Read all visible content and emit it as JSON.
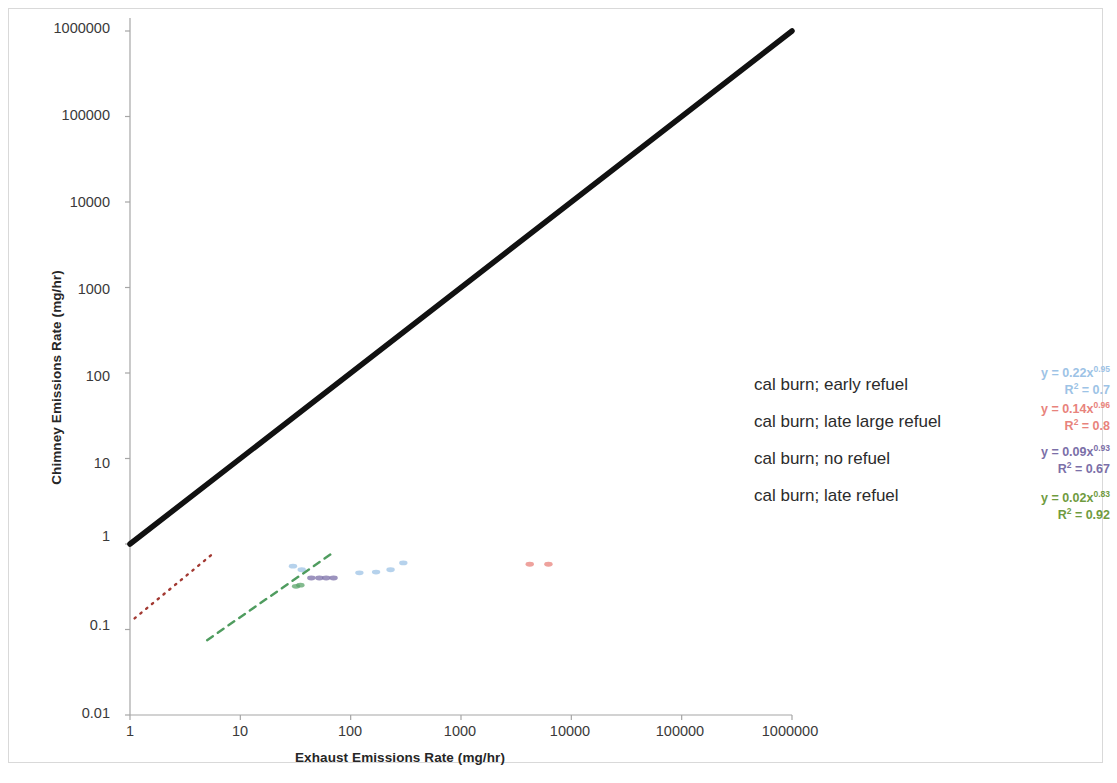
{
  "chart_data": {
    "type": "scatter",
    "title": "",
    "xlabel": "Exhaust Emissions Rate (mg/hr)",
    "ylabel": "Chimney Emissions Rate (mg/hr)",
    "xscale": "log",
    "yscale": "log",
    "xlim": [
      1,
      1000000
    ],
    "ylim": [
      0.01,
      1000000
    ],
    "xticks": [
      "1",
      "10",
      "100",
      "1000",
      "10000",
      "100000",
      "1000000"
    ],
    "yticks": [
      "0.01",
      "0.1",
      "1",
      "10",
      "100",
      "1000",
      "10000",
      "100000",
      "1000000"
    ],
    "grid": false,
    "legend_position": "right-inside",
    "reference_line": {
      "name": "1:1 line",
      "color": "#111111",
      "x": [
        1,
        1000000
      ],
      "y": [
        1,
        1000000
      ]
    },
    "series": [
      {
        "name": "cal burn; early refuel",
        "color": "#9dc3e6",
        "equation": "y = 0.22x",
        "exponent": "0.95",
        "r2_label": "R",
        "r2_sup": "2",
        "r2_value": " = 0.7",
        "points": [
          {
            "x": 30,
            "y": 0.55
          },
          {
            "x": 36,
            "y": 0.5
          },
          {
            "x": 120,
            "y": 0.46
          },
          {
            "x": 170,
            "y": 0.47
          },
          {
            "x": 230,
            "y": 0.5
          },
          {
            "x": 300,
            "y": 0.6
          }
        ]
      },
      {
        "name": "cal burn; late large refuel",
        "color": "#e8837c",
        "equation": "y = 0.14x",
        "exponent": "0.96",
        "r2_label": "R",
        "r2_sup": "2",
        "r2_value": " = 0.8",
        "trend": {
          "x": [
            1.1,
            5.5
          ],
          "y": [
            0.135,
            0.75
          ],
          "style": "dotted",
          "color": "#a33a33"
        },
        "points": [
          {
            "x": 4200,
            "y": 0.58
          },
          {
            "x": 6200,
            "y": 0.58
          }
        ]
      },
      {
        "name": "cal burn; no refuel",
        "color": "#7b6fa8",
        "equation": "y = 0.09x",
        "exponent": "0.93",
        "r2_label": "R",
        "r2_sup": "2",
        "r2_value": " = 0.67",
        "points": [
          {
            "x": 44,
            "y": 0.4
          },
          {
            "x": 52,
            "y": 0.4
          },
          {
            "x": 60,
            "y": 0.4
          },
          {
            "x": 70,
            "y": 0.4
          }
        ]
      },
      {
        "name": "cal burn; late refuel",
        "color": "#5aa469",
        "equation": "y = 0.02x",
        "exponent": "0.83",
        "r2_label": "R",
        "r2_sup": "2",
        "r2_value": " = 0.92",
        "trend": {
          "x": [
            5.0,
            70
          ],
          "y": [
            0.075,
            0.8
          ],
          "style": "dashed",
          "color": "#4f9c5f"
        },
        "points": [
          {
            "x": 32,
            "y": 0.32
          },
          {
            "x": 35,
            "y": 0.33
          }
        ]
      }
    ]
  },
  "axes": {
    "x_title": "Exhaust Emissions Rate (mg/hr)",
    "y_title": "Chimney Emissions Rate (mg/hr)",
    "x_ticks": [
      "1",
      "10",
      "100",
      "1000",
      "10000",
      "100000",
      "1000000"
    ],
    "y_ticks": [
      "1000000",
      "100000",
      "10000",
      "1000",
      "100",
      "10",
      "1",
      "0.1",
      "0.01"
    ]
  },
  "legend": {
    "items": [
      {
        "label": "cal burn; early refuel"
      },
      {
        "label": "cal burn; late large refuel"
      },
      {
        "label": "cal burn; no refuel"
      },
      {
        "label": "cal burn; late refuel"
      }
    ]
  },
  "equations": [
    {
      "eq_main": "y = 0.22x",
      "eq_sup": "0.95",
      "r2_pre": "R",
      "r2_sup": "2",
      "r2_post": " = 0.7",
      "color": "#9dc3e6"
    },
    {
      "eq_main": "y = 0.14x",
      "eq_sup": "0.96",
      "r2_pre": "R",
      "r2_sup": "2",
      "r2_post": " = 0.8",
      "color": "#e8837c"
    },
    {
      "eq_main": "y = 0.09x",
      "eq_sup": "0.93",
      "r2_pre": "R",
      "r2_sup": "2",
      "r2_post": " = 0.67",
      "color": "#7b6fa8"
    },
    {
      "eq_main": "y = 0.02x",
      "eq_sup": "0.83",
      "r2_pre": "R",
      "r2_sup": "2",
      "r2_post": " = 0.92",
      "color": "#6f9b3f"
    }
  ]
}
